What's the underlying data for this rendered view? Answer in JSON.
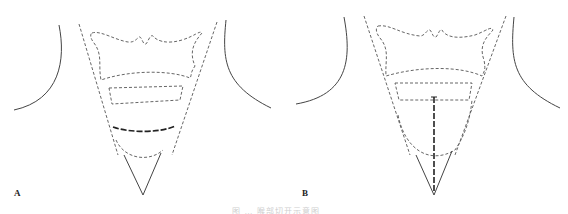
{
  "figure": {
    "panels": [
      {
        "id": "A",
        "label": "A",
        "description": "Neck outline with dashed thyroid/laryngeal regions and a bold dashed horizontal incision line"
      },
      {
        "id": "B",
        "label": "B",
        "description": "Neck outline with dashed regions and a bold dashed vertical midline incision"
      }
    ],
    "caption": "图 … 喉部切开示意图",
    "colors": {
      "line": "#444444",
      "dashed": "#555555",
      "bold_dashed": "#222222",
      "caption": "#cfcfcf"
    }
  }
}
